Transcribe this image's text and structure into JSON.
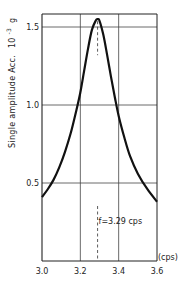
{
  "chart_data": {
    "type": "line",
    "title": "",
    "xlabel": "(cps)",
    "ylabel": "Single amplitude Acc.",
    "ylabel_unit": "10",
    "ylabel_unit_exp": "-3",
    "ylabel_unit_suffix": "g",
    "xlim": [
      3.0,
      3.6
    ],
    "ylim": [
      0.0,
      1.58
    ],
    "grid": true,
    "xticks": [
      3.0,
      3.2,
      3.4,
      3.6
    ],
    "xtick_labels": [
      "3.0",
      "3.2",
      "3.4",
      "3.6"
    ],
    "yticks": [
      0.5,
      1.0,
      1.5
    ],
    "ytick_labels": [
      "0.5",
      "1.0",
      "1.5"
    ],
    "series": [
      {
        "name": "response",
        "x": [
          3.0,
          3.03,
          3.06,
          3.09,
          3.12,
          3.15,
          3.18,
          3.2,
          3.22,
          3.24,
          3.26,
          3.28,
          3.29,
          3.3,
          3.32,
          3.34,
          3.36,
          3.38,
          3.4,
          3.43,
          3.46,
          3.5,
          3.55,
          3.6
        ],
        "y": [
          0.41,
          0.46,
          0.52,
          0.6,
          0.7,
          0.82,
          0.97,
          1.08,
          1.22,
          1.36,
          1.48,
          1.54,
          1.55,
          1.54,
          1.45,
          1.32,
          1.18,
          1.05,
          0.93,
          0.79,
          0.67,
          0.56,
          0.46,
          0.38
        ]
      }
    ],
    "annotations": [
      {
        "text": "f=3.29 cps",
        "x": 3.29,
        "y": 0.22,
        "type": "resonance-marker"
      }
    ],
    "resonance_frequency": 3.29,
    "peak_value": 1.55
  }
}
